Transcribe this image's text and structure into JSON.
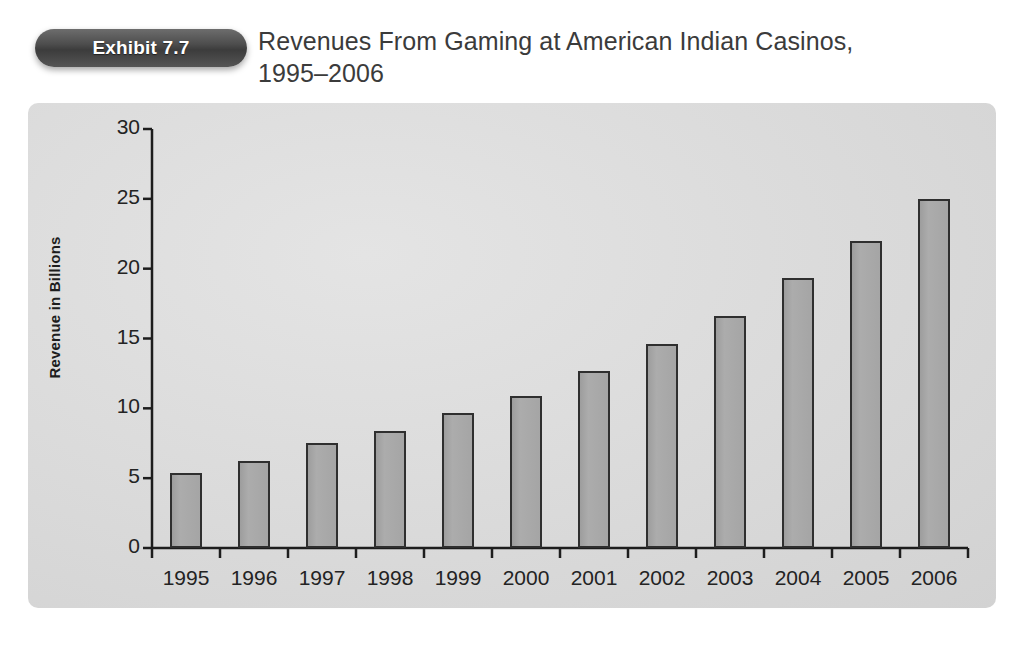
{
  "header": {
    "badge_label": "Exhibit 7.7",
    "title_line_1": "Revenues From Gaming at American Indian Casinos,",
    "title_line_2": "1995–2006"
  },
  "colors": {
    "page_background": "#ffffff",
    "panel_background": "#dcdcdc",
    "badge_background": "#454545",
    "badge_text": "#ffffff",
    "bar_fill": "#a8a8a8",
    "bar_border": "#2f2f2f",
    "axis_line": "#1d1d1d",
    "text": "#232323"
  },
  "chart_data": {
    "type": "bar",
    "title": "Revenues From Gaming at American Indian Casinos, 1995–2006",
    "xlabel": "",
    "ylabel": "Revenue in Billions",
    "categories": [
      "1995",
      "1996",
      "1997",
      "1998",
      "1999",
      "2000",
      "2001",
      "2002",
      "2003",
      "2004",
      "2005",
      "2006"
    ],
    "values": [
      5.4,
      6.2,
      7.5,
      8.4,
      9.7,
      10.9,
      12.7,
      14.6,
      16.6,
      19.3,
      22.0,
      25.0
    ],
    "ylim": [
      0,
      30
    ],
    "y_ticks": [
      0,
      5,
      10,
      15,
      20,
      25,
      30
    ],
    "y_tick_labels": [
      "0",
      "5",
      "10",
      "15",
      "20",
      "25",
      "30"
    ],
    "grid": false,
    "legend": "none"
  }
}
